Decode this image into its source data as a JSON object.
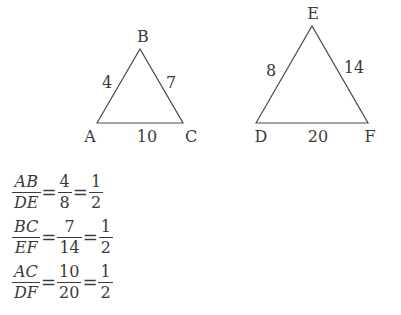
{
  "triangles": [
    {
      "name": "ABC",
      "vertices": [
        {
          "label": "A",
          "x": 97,
          "y": 123,
          "lx": 90,
          "ly": 142
        },
        {
          "label": "B",
          "x": 140,
          "y": 49,
          "lx": 143,
          "ly": 42
        },
        {
          "label": "C",
          "x": 183,
          "y": 123,
          "lx": 191,
          "ly": 142
        }
      ],
      "sides": [
        {
          "name": "AB",
          "label": "4",
          "lx": 107,
          "ly": 88
        },
        {
          "name": "BC",
          "label": "7",
          "lx": 171,
          "ly": 88
        },
        {
          "name": "AC",
          "label": "10",
          "lx": 147,
          "ly": 142
        }
      ]
    },
    {
      "name": "DEF",
      "vertices": [
        {
          "label": "D",
          "x": 256,
          "y": 123,
          "lx": 261,
          "ly": 142
        },
        {
          "label": "E",
          "x": 312,
          "y": 26,
          "lx": 313,
          "ly": 19
        },
        {
          "label": "F",
          "x": 368,
          "y": 123,
          "lx": 370,
          "ly": 142
        }
      ],
      "sides": [
        {
          "name": "DE",
          "label": "8",
          "lx": 271,
          "ly": 76
        },
        {
          "name": "EF",
          "label": "14",
          "lx": 354,
          "ly": 73
        },
        {
          "name": "DF",
          "label": "20",
          "lx": 318,
          "ly": 142
        }
      ]
    }
  ],
  "equations": [
    {
      "ratio": {
        "num": "AB",
        "den": "DE"
      },
      "values": {
        "num": "4",
        "den": "8"
      },
      "result": {
        "num": "1",
        "den": "2"
      }
    },
    {
      "ratio": {
        "num": "BC",
        "den": "EF"
      },
      "values": {
        "num": "7",
        "den": "14"
      },
      "result": {
        "num": "1",
        "den": "2"
      }
    },
    {
      "ratio": {
        "num": "AC",
        "den": "DF"
      },
      "values": {
        "num": "10",
        "den": "20"
      },
      "result": {
        "num": "1",
        "den": "2"
      }
    }
  ],
  "equals_sign": "=",
  "colors": {
    "stroke": "#4a4a4a",
    "text": "#3a3a3a",
    "background": "#ffffff"
  }
}
